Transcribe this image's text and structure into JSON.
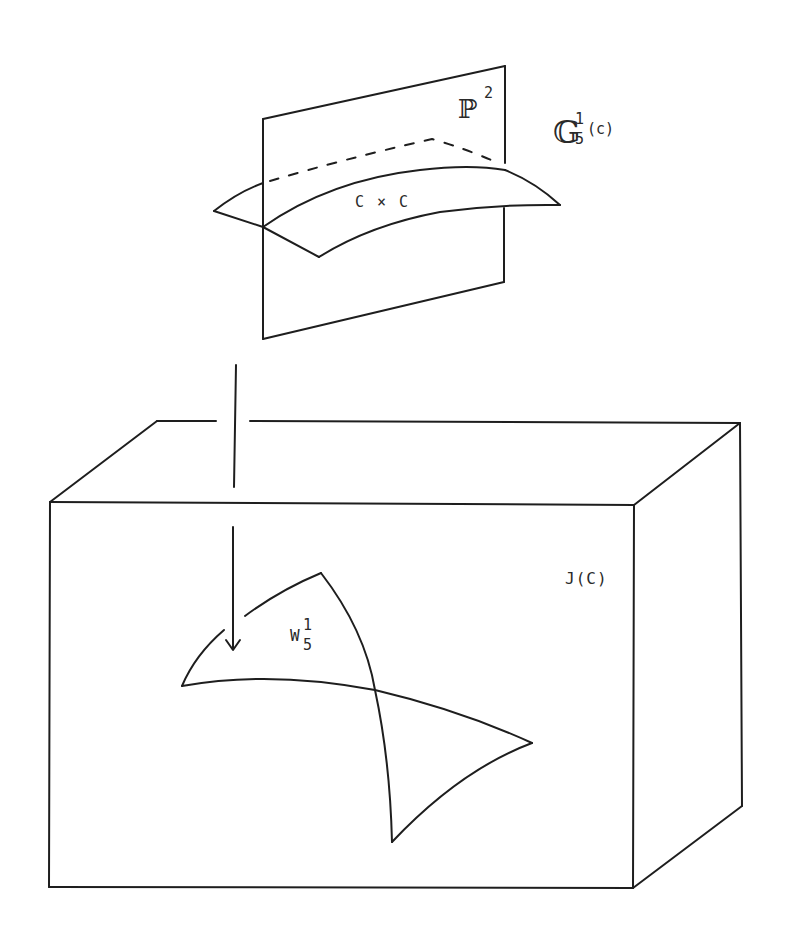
{
  "figure": {
    "type": "mathematical schematic"
  },
  "labels": {
    "projective_plane": {
      "base": "ℙ",
      "sup": "2"
    },
    "grassmannian": {
      "base": "𝔾",
      "sup": "1",
      "sub": "5",
      "arg": "(c)"
    },
    "product_surface": "C × C",
    "jacobian": "J(C)",
    "brill_noether_locus": {
      "base": "W",
      "sup": "1",
      "sub": "5"
    }
  },
  "colors": {
    "ink": "#1e1e1e",
    "background": "#ffffff"
  }
}
